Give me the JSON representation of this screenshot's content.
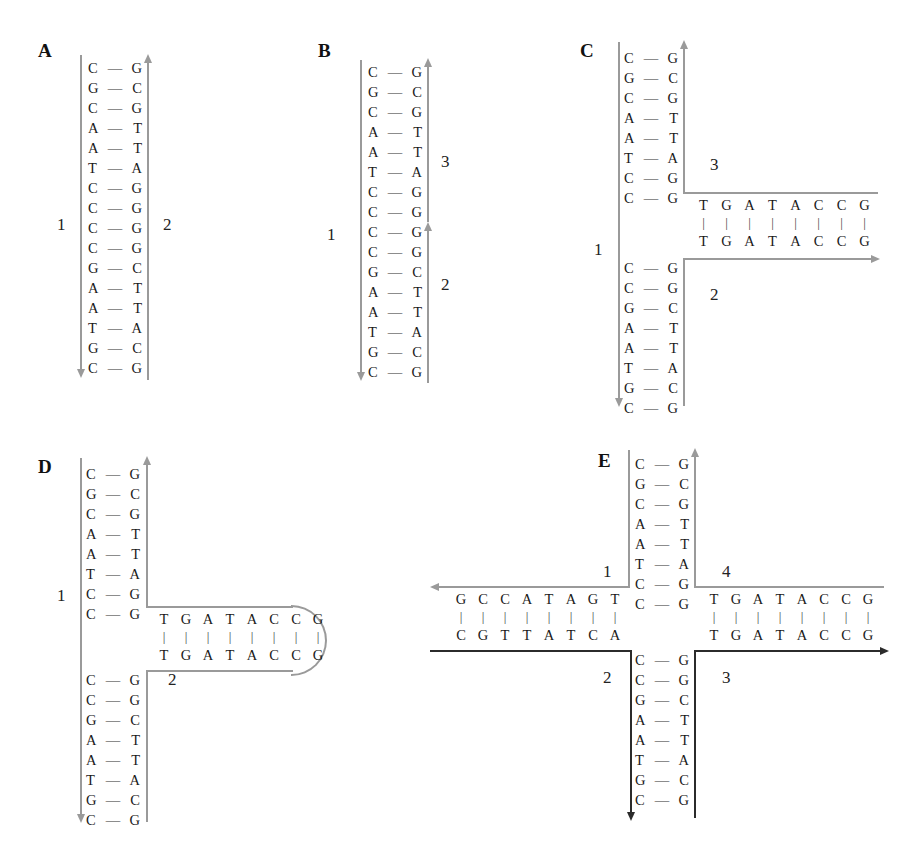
{
  "figure": {
    "panels": [
      {
        "id": "A",
        "label": "A",
        "type": "linear-duplex",
        "strand_labels": [
          "1",
          "2"
        ],
        "base_pairs": [
          {
            "left": "C",
            "right": "G"
          },
          {
            "left": "G",
            "right": "C"
          },
          {
            "left": "C",
            "right": "G"
          },
          {
            "left": "A",
            "right": "T"
          },
          {
            "left": "A",
            "right": "T"
          },
          {
            "left": "T",
            "right": "A"
          },
          {
            "left": "C",
            "right": "G"
          },
          {
            "left": "C",
            "right": "G"
          },
          {
            "left": "C",
            "right": "G"
          },
          {
            "left": "C",
            "right": "G"
          },
          {
            "left": "G",
            "right": "C"
          },
          {
            "left": "A",
            "right": "T"
          },
          {
            "left": "A",
            "right": "T"
          },
          {
            "left": "T",
            "right": "A"
          },
          {
            "left": "G",
            "right": "C"
          },
          {
            "left": "C",
            "right": "G"
          }
        ]
      },
      {
        "id": "B",
        "label": "B",
        "type": "nicked-duplex",
        "strand_labels": [
          "1",
          "2",
          "3"
        ],
        "nick_after_bp": 8,
        "base_pairs": [
          {
            "left": "C",
            "right": "G"
          },
          {
            "left": "G",
            "right": "C"
          },
          {
            "left": "C",
            "right": "G"
          },
          {
            "left": "A",
            "right": "T"
          },
          {
            "left": "A",
            "right": "T"
          },
          {
            "left": "T",
            "right": "A"
          },
          {
            "left": "C",
            "right": "G"
          },
          {
            "left": "C",
            "right": "G"
          },
          {
            "left": "C",
            "right": "G"
          },
          {
            "left": "C",
            "right": "G"
          },
          {
            "left": "G",
            "right": "C"
          },
          {
            "left": "A",
            "right": "T"
          },
          {
            "left": "A",
            "right": "T"
          },
          {
            "left": "T",
            "right": "A"
          },
          {
            "left": "G",
            "right": "C"
          },
          {
            "left": "C",
            "right": "G"
          }
        ]
      },
      {
        "id": "C",
        "label": "C",
        "type": "three-way-open",
        "strand_labels": [
          "1",
          "2",
          "3"
        ],
        "upper_base_pairs": [
          {
            "left": "C",
            "right": "G"
          },
          {
            "left": "G",
            "right": "C"
          },
          {
            "left": "C",
            "right": "G"
          },
          {
            "left": "A",
            "right": "T"
          },
          {
            "left": "A",
            "right": "T"
          },
          {
            "left": "T",
            "right": "A"
          },
          {
            "left": "C",
            "right": "G"
          },
          {
            "left": "C",
            "right": "G"
          }
        ],
        "lower_base_pairs": [
          {
            "left": "C",
            "right": "G"
          },
          {
            "left": "C",
            "right": "G"
          },
          {
            "left": "G",
            "right": "C"
          },
          {
            "left": "A",
            "right": "T"
          },
          {
            "left": "A",
            "right": "T"
          },
          {
            "left": "T",
            "right": "A"
          },
          {
            "left": "G",
            "right": "C"
          },
          {
            "left": "C",
            "right": "G"
          }
        ],
        "arm_top_sequence": [
          "T",
          "G",
          "A",
          "T",
          "A",
          "C",
          "C",
          "G"
        ],
        "arm_bottom_sequence": [
          "T",
          "G",
          "A",
          "T",
          "A",
          "C",
          "C",
          "G"
        ]
      },
      {
        "id": "D",
        "label": "D",
        "type": "hairpin-loop",
        "strand_labels": [
          "1",
          "2"
        ],
        "upper_base_pairs": [
          {
            "left": "C",
            "right": "G"
          },
          {
            "left": "G",
            "right": "C"
          },
          {
            "left": "C",
            "right": "G"
          },
          {
            "left": "A",
            "right": "T"
          },
          {
            "left": "A",
            "right": "T"
          },
          {
            "left": "T",
            "right": "A"
          },
          {
            "left": "C",
            "right": "G"
          },
          {
            "left": "C",
            "right": "G"
          }
        ],
        "lower_base_pairs": [
          {
            "left": "C",
            "right": "G"
          },
          {
            "left": "C",
            "right": "G"
          },
          {
            "left": "G",
            "right": "C"
          },
          {
            "left": "A",
            "right": "T"
          },
          {
            "left": "A",
            "right": "T"
          },
          {
            "left": "T",
            "right": "A"
          },
          {
            "left": "G",
            "right": "C"
          },
          {
            "left": "C",
            "right": "G"
          }
        ],
        "arm_top_sequence": [
          "T",
          "G",
          "A",
          "T",
          "A",
          "C",
          "C",
          "G"
        ],
        "arm_bottom_sequence": [
          "T",
          "G",
          "A",
          "T",
          "A",
          "C",
          "C",
          "G"
        ]
      },
      {
        "id": "E",
        "label": "E",
        "type": "four-way-junction",
        "strand_labels": [
          "1",
          "2",
          "3",
          "4"
        ],
        "upper_base_pairs": [
          {
            "left": "C",
            "right": "G"
          },
          {
            "left": "G",
            "right": "C"
          },
          {
            "left": "C",
            "right": "G"
          },
          {
            "left": "A",
            "right": "T"
          },
          {
            "left": "A",
            "right": "T"
          },
          {
            "left": "T",
            "right": "A"
          },
          {
            "left": "C",
            "right": "G"
          },
          {
            "left": "C",
            "right": "G"
          }
        ],
        "lower_base_pairs": [
          {
            "left": "C",
            "right": "G"
          },
          {
            "left": "C",
            "right": "G"
          },
          {
            "left": "G",
            "right": "C"
          },
          {
            "left": "A",
            "right": "T"
          },
          {
            "left": "A",
            "right": "T"
          },
          {
            "left": "T",
            "right": "A"
          },
          {
            "left": "G",
            "right": "C"
          },
          {
            "left": "C",
            "right": "G"
          }
        ],
        "left_arm_top_sequence": [
          "G",
          "C",
          "C",
          "A",
          "T",
          "A",
          "G",
          "T"
        ],
        "left_arm_bottom_sequence": [
          "C",
          "G",
          "T",
          "T",
          "A",
          "T",
          "C",
          "A"
        ],
        "right_arm_top_sequence": [
          "T",
          "G",
          "A",
          "T",
          "A",
          "C",
          "C",
          "G"
        ],
        "right_arm_bottom_sequence": [
          "T",
          "G",
          "A",
          "T",
          "A",
          "C",
          "C",
          "G"
        ]
      }
    ],
    "bond_glyph": "—",
    "vertical_bond_glyph": "|",
    "colors": {
      "light_strand": "#9a9a9a",
      "dark_strand": "#2b2b2b",
      "text": "#1a1a1a"
    }
  }
}
